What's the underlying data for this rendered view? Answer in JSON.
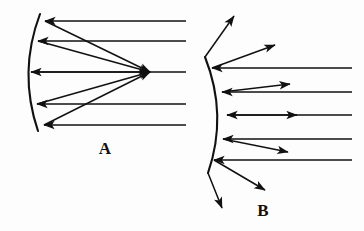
{
  "figure": {
    "background_color": "#fdfdfd",
    "ink_color": "#111111",
    "width": 364,
    "height": 231,
    "caption_font_weight": "bold",
    "panels": [
      {
        "id": "panel-a",
        "label": "A",
        "label_x": 105,
        "label_y": 154,
        "mirror_type": "concave",
        "mirror": {
          "top_x": 40,
          "top_y": 14,
          "bottom_x": 38,
          "bottom_y": 131,
          "bulge_x": 18,
          "bulge_y": 72,
          "stroke_width": 2.1
        },
        "focal_point": {
          "x": 150,
          "y": 72
        },
        "incoming_rays": [
          {
            "y": 21,
            "x_start": 186,
            "x_end": 45
          },
          {
            "y": 41,
            "x_start": 186,
            "x_end": 38
          },
          {
            "y": 72,
            "x_start": 186,
            "x_end": 31
          },
          {
            "y": 104,
            "x_start": 186,
            "x_end": 37
          },
          {
            "y": 125,
            "x_start": 186,
            "x_end": 44
          }
        ],
        "reflected_rays": [
          {
            "x1": 45,
            "y1": 21,
            "x2": 150,
            "y2": 72
          },
          {
            "x1": 38,
            "y1": 41,
            "x2": 150,
            "y2": 72
          },
          {
            "x1": 31,
            "y1": 72,
            "x2": 150,
            "y2": 72
          },
          {
            "x1": 37,
            "y1": 104,
            "x2": 150,
            "y2": 72
          },
          {
            "x1": 44,
            "y1": 125,
            "x2": 150,
            "y2": 72
          }
        ]
      },
      {
        "id": "panel-b",
        "label": "B",
        "label_x": 263,
        "label_y": 216,
        "mirror_type": "convex",
        "mirror": {
          "top_x": 205,
          "top_y": 57,
          "bottom_x": 208,
          "bottom_y": 173,
          "bulge_x": 228,
          "bulge_y": 115,
          "stroke_width": 2.1
        },
        "incoming_rays": [
          {
            "y": 68,
            "x_start": 352,
            "x_end": 212
          },
          {
            "y": 92,
            "x_start": 352,
            "x_end": 222
          },
          {
            "y": 115,
            "x_start": 352,
            "x_end": 227
          },
          {
            "y": 139,
            "x_start": 352,
            "x_end": 223
          },
          {
            "y": 160,
            "x_start": 352,
            "x_end": 214
          }
        ],
        "reflected_rays": [
          {
            "x1": 205,
            "y1": 57,
            "x2": 234,
            "y2": 16
          },
          {
            "x1": 212,
            "y1": 68,
            "x2": 275,
            "y2": 45
          },
          {
            "x1": 222,
            "y1": 92,
            "x2": 290,
            "y2": 84
          },
          {
            "x1": 227,
            "y1": 115,
            "x2": 297,
            "y2": 115
          },
          {
            "x1": 223,
            "y1": 139,
            "x2": 288,
            "y2": 152
          },
          {
            "x1": 214,
            "y1": 160,
            "x2": 265,
            "y2": 190
          },
          {
            "x1": 208,
            "y1": 173,
            "x2": 222,
            "y2": 208
          }
        ]
      }
    ]
  }
}
